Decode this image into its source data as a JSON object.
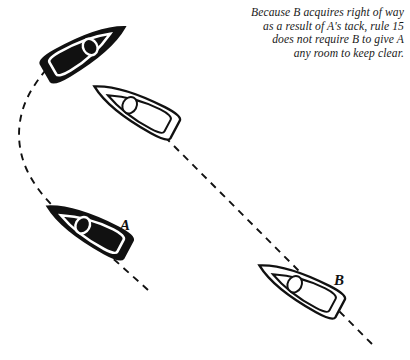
{
  "diagram": {
    "background_color": "#ffffff",
    "ink_color": "#111111",
    "caption": {
      "align": "right",
      "style": "italic-serif",
      "lines": [
        "Because B acquires right of way",
        "as a result of A's tack, rule 15",
        "does not require B to give A",
        "any room to keep clear."
      ],
      "full_text": "Because B acquires right of way as a result of A's tack, rule 15 does not require B to give A any room to keep clear."
    },
    "labels": [
      {
        "id": "A",
        "text": "A",
        "x": 120,
        "y": 217
      },
      {
        "id": "B",
        "text": "B",
        "x": 334,
        "y": 272
      }
    ],
    "boats": [
      {
        "id": "a-after-tack",
        "boat": "A",
        "fill": "black",
        "position": "upper-left",
        "heading": "up-right",
        "heading_degrees": 55,
        "cx": 85,
        "cy": 50,
        "length": 92,
        "beam": 30
      },
      {
        "id": "a-before-tack",
        "boat": "A",
        "fill": "black",
        "position": "lower-left",
        "heading": "up-left",
        "heading_degrees": 325,
        "cx": 88,
        "cy": 228,
        "length": 92,
        "beam": 30
      },
      {
        "id": "b-later",
        "boat": "B",
        "fill": "white",
        "position": "upper-middle",
        "heading": "up-left",
        "heading_degrees": 325,
        "cx": 135,
        "cy": 108,
        "length": 92,
        "beam": 30
      },
      {
        "id": "b-earlier",
        "boat": "B",
        "fill": "white",
        "position": "lower-right",
        "heading": "up-left",
        "heading_degrees": 325,
        "cx": 300,
        "cy": 287,
        "length": 92,
        "beam": 30
      }
    ],
    "tracks": [
      {
        "id": "track-a",
        "boat": "A",
        "style": "dashed",
        "shape": "curved-tack",
        "description": "A's track curves from lower right up and around to the left, reversing direction through the tack"
      },
      {
        "id": "track-b",
        "boat": "B",
        "style": "dashed",
        "shape": "straight",
        "description": "B's track is a straight line running from lower right to upper left"
      }
    ]
  }
}
